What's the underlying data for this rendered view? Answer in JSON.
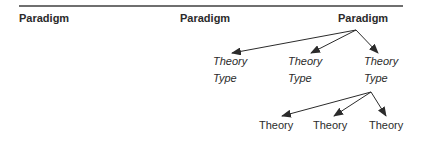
{
  "diagram": {
    "columns": [
      {
        "header": "Paradigm"
      },
      {
        "header": "Paradigm"
      },
      {
        "header": "Paradigm"
      }
    ],
    "theory_types": [
      {
        "line1": "Theory",
        "line2": "Type"
      },
      {
        "line1": "Theory",
        "line2": "Type"
      },
      {
        "line1": "Theory",
        "line2": "Type"
      }
    ],
    "theories": [
      {
        "label": "Theory"
      },
      {
        "label": "Theory"
      },
      {
        "label": "Theory"
      }
    ],
    "colors": {
      "text": "#2b2b2b",
      "rule": "#6f6f6f",
      "arrow": "#2b2b2b"
    }
  }
}
